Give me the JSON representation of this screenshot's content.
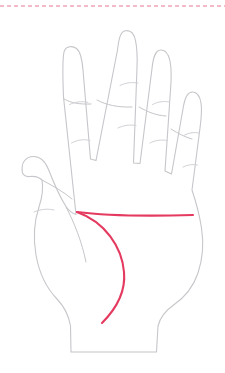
{
  "figure": {
    "width": 225,
    "height": 373,
    "background_color": "#ffffff"
  },
  "colors": {
    "hand_outline": "#c6c6cb",
    "finger_crease": "#d2d2d7",
    "palm_line_highlight": "#e53a5f",
    "divider_dashed": "#e8768f"
  },
  "strokes": {
    "hand_outline_width": 1.1,
    "finger_crease_width": 1,
    "palm_line_width": 2.1,
    "divider_width": 1.2,
    "divider_dash_pattern": "4 3"
  },
  "divider": {
    "label": "top-dashed-rule",
    "y": 6,
    "x_start": 0,
    "x_end": 225
  },
  "hand": {
    "label": "left-hand-outline",
    "outline_path": "M 22.5 173 C 20.5 163 25.5 156.5 33.5 156.5 C 41 156.5 45.5 162 48.5 169.5 C 54 183.5 60.5 198 66 206.5 C 69 211 72.5 213.5 76 214.5 L 63.5 97 C 62.5 72 62.5 55 64.5 50.5 C 66.5 46 72.5 45.5 76.5 48.5 C 80.5 51.5 82 58 83 70 L 90.5 159 L 96 160.5 L 117.5 50 C 119 36.5 121 31.5 125.5 30.8 C 130.5 30 134 33.5 135.5 40.5 C 137 47.5 137.5 56 137 68 L 133.5 163 L 140 163.5 L 152 68.5 C 153.5 55 156 50.3 160.5 50 C 165 49.7 168.5 53.5 170 61 C 171.5 68.5 171.5 78 170.5 90 L 165 171 L 171.5 174 L 183.5 106 C 185.5 95 188.5 91.5 193 92 C 197.5 92.5 200 96.5 201 103 C 202 109.5 201.5 117 200 128 L 192 190 C 196 202 199.5 215 201.5 228 C 204 244 203 258 198 273 C 193 288 184 298 173 305.5 C 165 311 160 318 158 326 L 156.5 352 L 71 352 L 70.5 326 C 69 316 64.5 307 57 299 C 46 287.5 39 272 36 255 C 33 238 34 222 39 207 C 42 198 43.5 189 42 180 C 39 177 34 176 29.5 176.5 C 26 177 24 175.5 22.5 173 Z",
    "inner_lines": [
      {
        "name": "index-finger-base-line",
        "path": "M 64 99 C 71 103 80 104.5 91 104"
      },
      {
        "name": "middle-finger-base-line",
        "path": "M 97 100 C 106 105 118 107.5 132 107"
      },
      {
        "name": "ring-finger-base-line",
        "path": "M 139 107 C 148 112 156 115.5 166 116"
      },
      {
        "name": "pinky-finger-base-line",
        "path": "M 171 129 C 179 134 185 137 192 139"
      },
      {
        "name": "thumb-web-line",
        "path": "M 66 207 C 74 222 82 242 86 262"
      },
      {
        "name": "thumb-base-fold",
        "path": "M 42 180 C 53 186 64 192 72 199"
      }
    ],
    "fingers": [
      {
        "name": "index-finger",
        "creases": [
          {
            "name": "index-upper-crease",
            "path": "M 69.5 104.5 C 76 101.5 82.5 101 88 102.5"
          },
          {
            "name": "index-lower-crease",
            "path": "M 71.5 143 C 78 139.5 84.5 139 90 140.5"
          }
        ]
      },
      {
        "name": "middle-finger",
        "creases": [
          {
            "name": "middle-upper-crease",
            "path": "M 120 85.5 C 126 82.5 132.5 82 138 83"
          },
          {
            "name": "middle-lower-crease",
            "path": "M 118 128 C 124 125 130.5 124.5 136 125.5"
          }
        ]
      },
      {
        "name": "ring-finger",
        "creases": [
          {
            "name": "ring-upper-crease",
            "path": "M 152.5 104.5 C 158 101.5 164 101 169.5 102"
          },
          {
            "name": "ring-lower-crease",
            "path": "M 150 143 C 155.5 140 161.5 139.5 167 140.5"
          }
        ]
      },
      {
        "name": "pinky-finger",
        "creases": [
          {
            "name": "pinky-upper-crease",
            "path": "M 184.5 135 C 189.5 132.5 194.5 132 199 133"
          },
          {
            "name": "pinky-lower-crease",
            "path": "M 183 167 C 188 164.5 193 164 197.5 165"
          }
        ]
      },
      {
        "name": "thumb",
        "creases": [
          {
            "name": "thumb-crease",
            "path": "M 34 212 C 41 209 48 208.5 54 210"
          }
        ]
      }
    ]
  },
  "palm_lines": [
    {
      "name": "heart-line",
      "label": "heart line",
      "highlighted": true,
      "path": "M 77 212 C 100 215 140 216.5 193 215",
      "start": [
        77,
        212
      ],
      "end": [
        193,
        215
      ]
    },
    {
      "name": "life-line",
      "label": "life line",
      "highlighted": true,
      "path": "M 77 212 C 105 222 122 247 124 272 C 126 293 115 310 102 323",
      "start": [
        77,
        212
      ],
      "end": [
        102,
        323
      ]
    }
  ]
}
